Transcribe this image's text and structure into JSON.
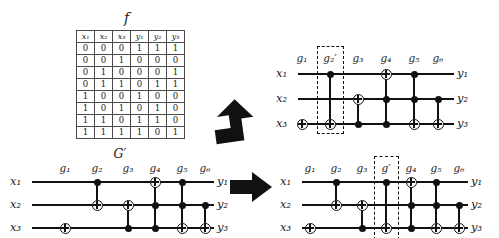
{
  "figure": {
    "truth_table": {
      "title": "f",
      "headers": [
        "x₁",
        "x₂",
        "x₃",
        "y₁",
        "y₂",
        "y₃"
      ],
      "rows": [
        [
          "0",
          "0",
          "0",
          "1",
          "1",
          "1"
        ],
        [
          "0",
          "0",
          "1",
          "0",
          "0",
          "0"
        ],
        [
          "0",
          "1",
          "0",
          "0",
          "0",
          "1"
        ],
        [
          "0",
          "1",
          "1",
          "0",
          "1",
          "1"
        ],
        [
          "1",
          "0",
          "0",
          "1",
          "0",
          "0"
        ],
        [
          "1",
          "0",
          "1",
          "0",
          "1",
          "0"
        ],
        [
          "1",
          "1",
          "0",
          "1",
          "1",
          "0"
        ],
        [
          "1",
          "1",
          "1",
          "1",
          "0",
          "1"
        ]
      ]
    },
    "circuit_bottom_left": {
      "title": "G′",
      "input_labels": [
        "x₁",
        "x₂",
        "x₃"
      ],
      "output_labels": [
        "y₁",
        "y₂",
        "y₃"
      ],
      "gate_labels": [
        "g₁",
        "g₂",
        "g₃",
        "g₄",
        "g₅",
        "g₆"
      ]
    },
    "circuit_top_right": {
      "input_labels": [
        "x₁",
        "x₂",
        "x₃"
      ],
      "output_labels": [
        "y₁",
        "y₂",
        "y₃"
      ],
      "gate_labels": [
        "g₁",
        "g₂′",
        "g₃",
        "g₄",
        "g₅",
        "g₆"
      ],
      "highlighted_gate": "g₂′"
    },
    "circuit_bottom_right": {
      "input_labels": [
        "x₁",
        "x₂",
        "x₃"
      ],
      "output_labels": [
        "y₁",
        "y₂",
        "y₃"
      ],
      "gate_labels": [
        "g₁",
        "g₂",
        "g₃",
        "g′",
        "g₄",
        "g₅",
        "g₆"
      ],
      "highlighted_gate": "g′"
    },
    "arrows": [
      "arrow-up-right",
      "arrow-right"
    ],
    "colors": {
      "ink": "#111111",
      "rule": "#4a4a4a",
      "paper": "#ffffff"
    }
  }
}
